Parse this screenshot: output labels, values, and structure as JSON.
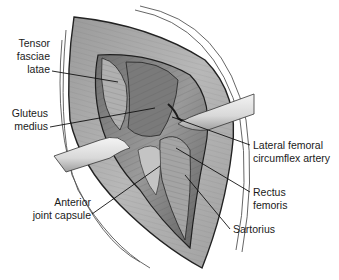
{
  "figure": {
    "type": "surgical-anatomy-illustration",
    "background": "#ffffff",
    "labels": [
      {
        "id": "tensor-fasciae-latae",
        "lines": [
          "Tensor",
          "fasciae",
          "latae"
        ]
      },
      {
        "id": "gluteus-medius",
        "lines": [
          "Gluteus",
          "medius"
        ]
      },
      {
        "id": "lateral-femoral-circumflex-artery",
        "lines": [
          "Lateral femoral",
          "circumflex artery"
        ]
      },
      {
        "id": "rectus-femoris",
        "lines": [
          "Rectus",
          "femoris"
        ]
      },
      {
        "id": "sartorius",
        "lines": [
          "Sartorius"
        ]
      },
      {
        "id": "anterior-joint-capsule",
        "lines": [
          "Anterior",
          "joint capsule"
        ]
      }
    ],
    "colors": {
      "text": "#1a1a1a",
      "leader_line": "#111111",
      "tissue_dark": "#5a5a5a",
      "tissue_mid": "#8c8c8c",
      "tissue_light": "#c8c8c8",
      "retractor": "#e6e6e6"
    }
  }
}
